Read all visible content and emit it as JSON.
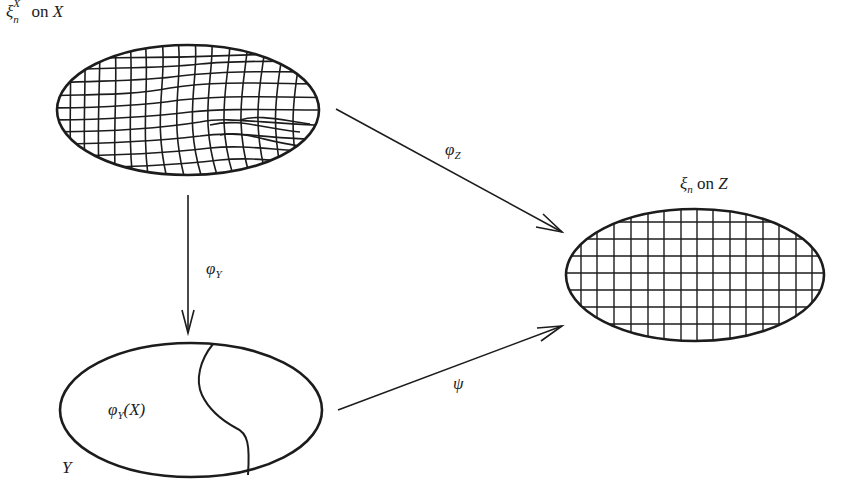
{
  "diagram": {
    "type": "commutative-diagram",
    "colors": {
      "stroke": "#1c1c1c",
      "background": "#ffffff"
    },
    "nodes": [
      {
        "id": "X",
        "label_main": "ξ",
        "label_sub": "n",
        "label_sup": "X",
        "label_rest": " on ",
        "label_space": "X",
        "grid": "distorted"
      },
      {
        "id": "Z",
        "label_main": "ξ",
        "label_sub": "n",
        "label_rest": " on ",
        "label_space": "Z",
        "grid": "regular"
      },
      {
        "id": "Y",
        "label_space": "Y",
        "region_label_main": "φ",
        "region_label_sub": "Y",
        "region_label_rest": "(X)",
        "grid": "none"
      }
    ],
    "edges": [
      {
        "from": "X",
        "to": "Z",
        "label_main": "φ",
        "label_sub": "Z"
      },
      {
        "from": "X",
        "to": "Y",
        "label_main": "φ",
        "label_sub": "Y"
      },
      {
        "from": "Y",
        "to": "Z",
        "label_main": "ψ"
      }
    ]
  }
}
